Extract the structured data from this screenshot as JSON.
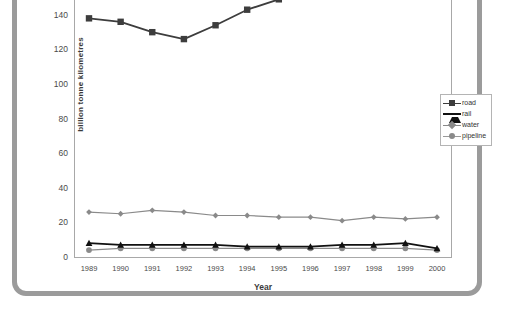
{
  "chart_data": {
    "type": "line",
    "title": "",
    "xlabel": "Year",
    "ylabel": "billion tonne kilometres",
    "categories": [
      "1989",
      "1990",
      "1991",
      "1992",
      "1993",
      "1994",
      "1995",
      "1996",
      "1997",
      "1998",
      "1999",
      "2000"
    ],
    "x": [
      1989,
      1990,
      1991,
      1992,
      1993,
      1994,
      1995,
      1996,
      1997,
      1998,
      1999,
      2000
    ],
    "ylim": [
      0,
      170
    ],
    "yticks": [
      0,
      20,
      40,
      60,
      80,
      100,
      120,
      140,
      160
    ],
    "ytick_labels": [
      "0",
      "20",
      "40",
      "60",
      "80",
      "100",
      "120",
      "140",
      "160"
    ],
    "grid": false,
    "legend_position": "right",
    "series": [
      {
        "name": "road",
        "marker": "square",
        "color": "#3d3d3d",
        "values": [
          138,
          136,
          130,
          126,
          134,
          143,
          149,
          153,
          157,
          159,
          156,
          160
        ]
      },
      {
        "name": "rail",
        "marker": "triangle",
        "color": "#111111",
        "values": [
          8,
          7,
          7,
          7,
          7,
          6,
          6,
          6,
          7,
          7,
          8,
          5
        ]
      },
      {
        "name": "water",
        "marker": "diamond",
        "color": "#8a8a8a",
        "values": [
          26,
          25,
          27,
          26,
          24,
          24,
          23,
          23,
          21,
          23,
          22,
          23
        ]
      },
      {
        "name": "pipeline",
        "marker": "circle",
        "color": "#8a8a8a",
        "values": [
          4,
          5,
          5,
          5,
          5,
          5,
          5,
          5,
          5,
          5,
          5,
          4
        ]
      }
    ]
  },
  "legend": {
    "items": [
      {
        "label": "road"
      },
      {
        "label": "rail"
      },
      {
        "label": "water"
      },
      {
        "label": "pipeline"
      }
    ]
  },
  "axes": {
    "x_title": "Year",
    "y_title": "billion tonne kilometres"
  }
}
